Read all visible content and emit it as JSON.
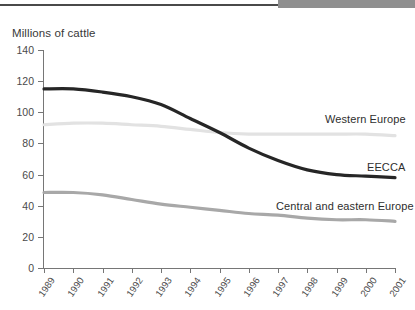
{
  "header": {
    "rule_color": "#4a4a4a",
    "accent_color": "#8f8f8f"
  },
  "chart_data": {
    "type": "line",
    "title": "",
    "ylabel": "Millions of cattle",
    "xlabel": "",
    "ylim": [
      0,
      140
    ],
    "ytick_values": [
      0,
      20,
      40,
      60,
      80,
      100,
      120,
      140
    ],
    "ytick_labels": [
      "0",
      "20",
      "40",
      "60",
      "80",
      "100",
      "120",
      "140"
    ],
    "grid": false,
    "legend_position": "inline-right",
    "categories": [
      1989,
      1990,
      1991,
      1992,
      1993,
      1994,
      1995,
      1996,
      1997,
      1998,
      1999,
      2000,
      2001
    ],
    "xtick_labels": [
      "1989",
      "1990",
      "1991",
      "1992",
      "1993",
      "1994",
      "1995",
      "1996",
      "1997",
      "1998",
      "1999",
      "2000",
      "2001"
    ],
    "series": [
      {
        "name": "EECCA",
        "color": "#262626",
        "width": 3.2,
        "values": [
          115,
          115,
          113,
          110,
          105,
          96,
          87,
          77,
          69,
          63,
          60,
          59,
          58
        ]
      },
      {
        "name": "Western Europe",
        "color": "#e2e2e2",
        "width": 3.2,
        "values": [
          92,
          93,
          93,
          92,
          91,
          89,
          87,
          86,
          86,
          86,
          86,
          86,
          85
        ]
      },
      {
        "name": "Central and eastern Europe",
        "color": "#a8a8a8",
        "width": 3.2,
        "values": [
          48.5,
          48.5,
          47,
          44,
          41,
          39,
          37,
          35,
          34,
          32,
          31,
          31,
          30
        ]
      }
    ],
    "annotations": [
      {
        "text": "Western Europe",
        "series": "Western Europe"
      },
      {
        "text": "EECCA",
        "series": "EECCA"
      },
      {
        "text": "Central and eastern Europe",
        "series": "Central and eastern Europe"
      }
    ]
  }
}
